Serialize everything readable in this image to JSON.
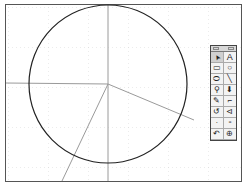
{
  "canvas": {
    "frame": {
      "x": 5,
      "y": 4,
      "width": 237,
      "height": 178
    },
    "grid": {
      "spacing": 40,
      "style": "dotted",
      "color": "#bbbbbb"
    },
    "circle": {
      "cx": 108,
      "cy": 84,
      "r": 79,
      "stroke": "#222222"
    },
    "axes": {
      "horizontal": {
        "x1": 5,
        "y1": 83,
        "x2": 108,
        "y2": 84
      },
      "vertical": {
        "x1": 108,
        "y1": 4,
        "x2": 108,
        "y2": 183
      }
    },
    "radial_lines": [
      {
        "x1": 108,
        "y1": 84,
        "x2": 194,
        "y2": 120
      },
      {
        "x1": 108,
        "y1": 84,
        "x2": 62,
        "y2": 183
      }
    ],
    "line_color": "#9a9a9a"
  },
  "palette": {
    "tools": [
      {
        "name": "select-arrow",
        "glyph": "➤"
      },
      {
        "name": "text",
        "glyph": "A"
      },
      {
        "name": "rectangle",
        "glyph": "▭"
      },
      {
        "name": "circle",
        "glyph": "○"
      },
      {
        "name": "ellipse",
        "glyph": "⬭"
      },
      {
        "name": "line",
        "glyph": "╲"
      },
      {
        "name": "compass",
        "glyph": "⚲"
      },
      {
        "name": "point",
        "glyph": "⬇"
      },
      {
        "name": "pencil",
        "glyph": "✎"
      },
      {
        "name": "polygon",
        "glyph": "⌐"
      },
      {
        "name": "rotate",
        "glyph": "↺"
      },
      {
        "name": "reflect",
        "glyph": "⊲"
      },
      {
        "name": "dilate",
        "glyph": "·"
      },
      {
        "name": "translate",
        "glyph": "⁃"
      },
      {
        "name": "undo",
        "glyph": "↶"
      },
      {
        "name": "zoom",
        "glyph": "⊕"
      }
    ]
  }
}
